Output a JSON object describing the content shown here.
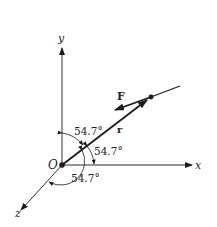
{
  "diagram": {
    "type": "3d-vector-diagram",
    "axes": {
      "x_label": "x",
      "y_label": "y",
      "z_label": "z",
      "origin_label": "O"
    },
    "vectors": {
      "position_label": "r",
      "force_label": "F"
    },
    "angles": {
      "with_y": "54.7°",
      "with_x": "54.7°",
      "with_z": "54.7°"
    },
    "colors": {
      "ink": "#1a1a1a",
      "background": "#ffffff"
    }
  }
}
